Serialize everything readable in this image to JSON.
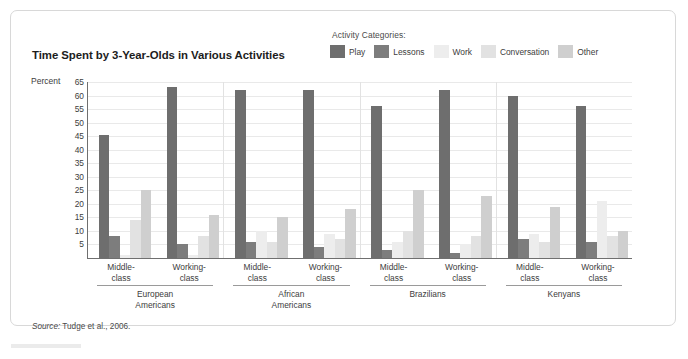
{
  "chart_title": "Time Spent by 3-Year-Olds in Various Activities",
  "legend": {
    "title": "Activity Categories:",
    "items": [
      {
        "label": "Play",
        "color": "#6e6e6e"
      },
      {
        "label": "Lessons",
        "color": "#7d7d7d"
      },
      {
        "label": "Work",
        "color": "#ededed"
      },
      {
        "label": "Conversation",
        "color": "#e2e2e2"
      },
      {
        "label": "Other",
        "color": "#cfcfcf"
      }
    ]
  },
  "source": {
    "prefix": "Source:",
    "text": "Tudge et al., 2006."
  },
  "chart_data": {
    "type": "bar",
    "title": "Time Spent by 3-Year-Olds in Various Activities",
    "xlabel": "",
    "ylabel": "Percent",
    "ylim": [
      0,
      65
    ],
    "yticks": [
      65,
      60,
      55,
      50,
      45,
      40,
      35,
      30,
      25,
      20,
      15,
      10,
      5
    ],
    "grid": true,
    "legend_position": "top-right",
    "categories": [
      "European Americans / Middle-class",
      "European Americans / Working-class",
      "African Americans / Middle-class",
      "African Americans / Working-class",
      "Brazilians / Middle-class",
      "Brazilians / Working-class",
      "Kenyans / Middle-class",
      "Kenyans / Working-class"
    ],
    "groups": [
      {
        "name": "European Americans",
        "subgroups": [
          {
            "name": "Middle-class",
            "line1": "Middle-",
            "line2": "class",
            "values": [
              45.5,
              8,
              1,
              14,
              25
            ]
          },
          {
            "name": "Working-class",
            "line1": "Working-",
            "line2": "class",
            "values": [
              63,
              5,
              1,
              8,
              16
            ]
          }
        ]
      },
      {
        "name": "African Americans",
        "line1": "African",
        "line2": "Americans",
        "subgroups": [
          {
            "name": "Middle-class",
            "line1": "Middle-",
            "line2": "class",
            "values": [
              62,
              6,
              10,
              6,
              15
            ]
          },
          {
            "name": "Working-class",
            "line1": "Working-",
            "line2": "class",
            "values": [
              62,
              4,
              9,
              7,
              18
            ]
          }
        ]
      },
      {
        "name": "Brazilians",
        "subgroups": [
          {
            "name": "Middle-class",
            "line1": "Middle-",
            "line2": "class",
            "values": [
              56,
              3,
              6,
              10,
              25
            ]
          },
          {
            "name": "Working-class",
            "line1": "Working-",
            "line2": "class",
            "values": [
              62,
              2,
              5,
              8,
              23
            ]
          }
        ]
      },
      {
        "name": "Kenyans",
        "subgroups": [
          {
            "name": "Middle-class",
            "line1": "Middle-",
            "line2": "class",
            "values": [
              60,
              7,
              9,
              6,
              19
            ]
          },
          {
            "name": "Working-class",
            "line1": "Working-",
            "line2": "class",
            "values": [
              56,
              6,
              21,
              8,
              10
            ]
          }
        ]
      }
    ],
    "group_labels": [
      {
        "line1": "European",
        "line2": "Americans"
      },
      {
        "line1": "African",
        "line2": "Americans"
      },
      {
        "line1": "Brazilians",
        "line2": ""
      },
      {
        "line1": "Kenyans",
        "line2": ""
      }
    ],
    "series": [
      {
        "name": "Play",
        "color": "#6e6e6e",
        "values": [
          45.5,
          63,
          62,
          62,
          56,
          62,
          60,
          56
        ]
      },
      {
        "name": "Lessons",
        "color": "#7d7d7d",
        "values": [
          8,
          5,
          6,
          4,
          3,
          2,
          7,
          6
        ]
      },
      {
        "name": "Work",
        "color": "#ededed",
        "values": [
          1,
          1,
          10,
          9,
          6,
          5,
          9,
          21
        ]
      },
      {
        "name": "Conversation",
        "color": "#e2e2e2",
        "values": [
          14,
          8,
          6,
          7,
          10,
          8,
          6,
          8
        ]
      },
      {
        "name": "Other",
        "color": "#cfcfcf",
        "values": [
          25,
          16,
          15,
          18,
          25,
          23,
          19,
          10
        ]
      }
    ]
  }
}
